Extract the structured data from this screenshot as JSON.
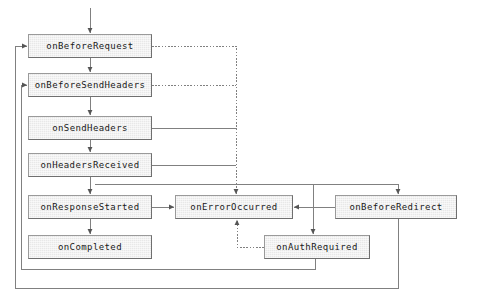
{
  "diagram": {
    "canvas": {
      "width": 477,
      "height": 303,
      "background": "#ffffff"
    },
    "style": {
      "node_fill": "#e8e8e8",
      "node_border_light": "#9a9a9a",
      "node_border_dark": "#6f6f6f",
      "edge_color": "#808080",
      "text_color": "#1a1a1a"
    },
    "nodes": [
      {
        "id": "onBeforeRequest",
        "label": "onBeforeRequest",
        "x": 28,
        "y": 34,
        "w": 124,
        "h": 24
      },
      {
        "id": "onBeforeSendHeaders",
        "label": "onBeforeSendHeaders",
        "x": 28,
        "y": 73,
        "w": 124,
        "h": 24
      },
      {
        "id": "onSendHeaders",
        "label": "onSendHeaders",
        "x": 28,
        "y": 116,
        "w": 124,
        "h": 24
      },
      {
        "id": "onHeadersReceived",
        "label": "onHeadersReceived",
        "x": 28,
        "y": 153,
        "w": 124,
        "h": 24
      },
      {
        "id": "onResponseStarted",
        "label": "onResponseStarted",
        "x": 28,
        "y": 195,
        "w": 124,
        "h": 24
      },
      {
        "id": "onCompleted",
        "label": "onCompleted",
        "x": 28,
        "y": 235,
        "w": 124,
        "h": 24
      },
      {
        "id": "onErrorOccurred",
        "label": "onErrorOccurred",
        "x": 175,
        "y": 195,
        "w": 118,
        "h": 24
      },
      {
        "id": "onBeforeRedirect",
        "label": "onBeforeRedirect",
        "x": 335,
        "y": 195,
        "w": 122,
        "h": 24
      },
      {
        "id": "onAuthRequired",
        "label": "onAuthRequired",
        "x": 264,
        "y": 235,
        "w": 106,
        "h": 24
      }
    ],
    "edges": [
      {
        "id": "entry-to-onBeforeRequest",
        "from": "start",
        "to": "onBeforeRequest",
        "style": "solid",
        "arrow": true,
        "points": "90,8 90,33"
      },
      {
        "id": "onBeforeRequest-to-onBeforeSendHeaders",
        "from": "onBeforeRequest",
        "to": "onBeforeSendHeaders",
        "style": "solid",
        "arrow": true,
        "points": "90,58 90,72"
      },
      {
        "id": "onBeforeSendHeaders-to-onSendHeaders",
        "from": "onBeforeSendHeaders",
        "to": "onSendHeaders",
        "style": "solid",
        "arrow": true,
        "points": "90,97 90,115"
      },
      {
        "id": "onSendHeaders-to-onHeadersReceived",
        "from": "onSendHeaders",
        "to": "onHeadersReceived",
        "style": "solid",
        "arrow": true,
        "points": "90,140 90,152"
      },
      {
        "id": "onHeadersReceived-to-onResponseStarted",
        "from": "onHeadersReceived",
        "to": "onResponseStarted",
        "style": "solid",
        "arrow": true,
        "points": "90,177 90,194"
      },
      {
        "id": "onResponseStarted-to-onCompleted",
        "from": "onResponseStarted",
        "to": "onCompleted",
        "style": "solid",
        "arrow": true,
        "points": "90,219 90,234"
      },
      {
        "id": "onBeforeRequest-to-onErrorOccurred",
        "from": "onBeforeRequest",
        "to": "onErrorOccurred",
        "style": "dotted",
        "arrow": true,
        "points": "152,46 236,46 236,194"
      },
      {
        "id": "onBeforeSendHeaders-to-onErrorOccurred",
        "from": "onBeforeSendHeaders",
        "to": "onErrorOccurred",
        "style": "dotted",
        "arrow": false,
        "points": "152,85 236,85"
      },
      {
        "id": "onSendHeaders-to-onErrorOccurred",
        "from": "onSendHeaders",
        "to": "onErrorOccurred",
        "style": "solid",
        "arrow": false,
        "points": "152,128 236,128"
      },
      {
        "id": "onHeadersReceived-to-onErrorOccurred",
        "from": "onHeadersReceived",
        "to": "onErrorOccurred",
        "style": "solid",
        "arrow": false,
        "points": "152,165 236,165"
      },
      {
        "id": "onResponseStarted-to-onErrorOccurred",
        "from": "onResponseStarted",
        "to": "onErrorOccurred",
        "style": "solid",
        "arrow": true,
        "points": "152,207 174,207"
      },
      {
        "id": "onHeadersReceived-to-onBeforeRedirect",
        "from": "onHeadersReceived",
        "to": "onBeforeRedirect",
        "style": "solid",
        "arrow": true,
        "points": "95,184 398,184 398,194"
      },
      {
        "id": "onBeforeRedirect-to-onErrorOccurred",
        "from": "onBeforeRedirect",
        "to": "onErrorOccurred",
        "style": "solid",
        "arrow": true,
        "points": "335,207 294,207"
      },
      {
        "id": "onHeadersReceived-to-onAuthRequired",
        "from": "onHeadersReceived",
        "to": "onAuthRequired",
        "style": "solid",
        "arrow": true,
        "points": "313,184 313,234"
      },
      {
        "id": "onAuthRequired-to-onErrorOccurred",
        "from": "onAuthRequired",
        "to": "onErrorOccurred",
        "style": "dotted",
        "arrow": true,
        "points": "264,247 237,247 237,220"
      },
      {
        "id": "onAuthRequired-to-onBeforeSendHeaders",
        "from": "onAuthRequired",
        "to": "onBeforeSendHeaders",
        "style": "solid",
        "arrow": true,
        "points": "315,259 315,269 21,269 21,85 27,85"
      },
      {
        "id": "onBeforeRedirect-to-onBeforeRequest",
        "from": "onBeforeRedirect",
        "to": "onBeforeRequest",
        "style": "solid",
        "arrow": true,
        "points": "398,219 398,288 15,288 15,46 27,46"
      }
    ]
  }
}
